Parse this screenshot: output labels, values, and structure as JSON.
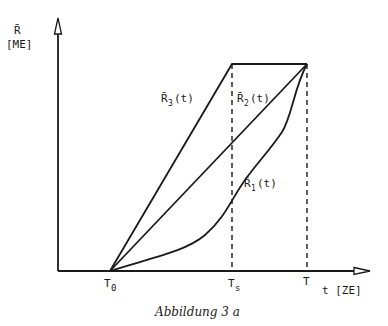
{
  "figure": {
    "caption": "Abbildung 3 a",
    "y_axis": {
      "symbol": "R̄",
      "unit": "[ME]"
    },
    "x_axis": {
      "label": "t [ZE]"
    },
    "ticks": [
      {
        "id": "T0",
        "main": "T",
        "sub": "0"
      },
      {
        "id": "Ts",
        "main": "T",
        "sub": "s"
      },
      {
        "id": "T",
        "main": "T",
        "sub": ""
      }
    ],
    "curves": [
      {
        "id": "R3",
        "main": "R̄",
        "sub": "3",
        "arg": "(t)",
        "shape": "linear, reaches max at Ts then constant to T"
      },
      {
        "id": "R2",
        "main": "R̄",
        "sub": "2",
        "arg": "(t)",
        "shape": "linear from T0 to T"
      },
      {
        "id": "R1",
        "main": "R̄",
        "sub": "1",
        "arg": "(t)",
        "shape": "convex/s-shaped from T0 to T"
      }
    ]
  }
}
